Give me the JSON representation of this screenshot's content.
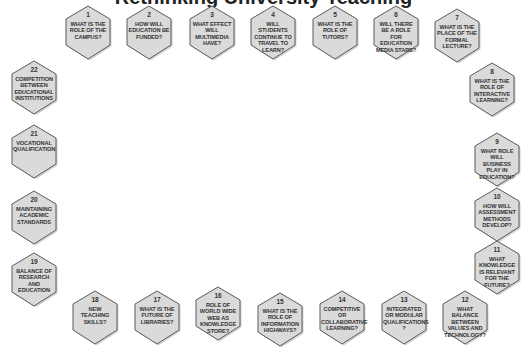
{
  "title": "Rethinking University Teaching",
  "colors": {
    "hex_fill": "#dadada",
    "hex_stroke": "#5a5a5a",
    "text": "#333333",
    "background": "#ffffff"
  },
  "questions": [
    {
      "num": "1",
      "text": "WHAT IS THE ROLE OF THE CAMPUS?",
      "x": 88,
      "y": 33
    },
    {
      "num": "2",
      "text": "HOW WILL EDUCATION BE FUNDED?",
      "x": 149,
      "y": 33
    },
    {
      "num": "3",
      "text": "WHAT EFFECT WILL MULTIMEDIA HAVE?",
      "x": 212,
      "y": 33
    },
    {
      "num": "4",
      "text": "WILL STUDENTS CONTINUE TO TRAVEL TO LEARN?",
      "x": 273,
      "y": 33
    },
    {
      "num": "5",
      "text": "WHAT IS THE ROLE OF TUTORS?",
      "x": 335,
      "y": 33
    },
    {
      "num": "6",
      "text": "WILL THERE BE A ROLE FOR EDUCATION MEDIA STARS?",
      "x": 396,
      "y": 33
    },
    {
      "num": "7",
      "text": "WHAT IS THE PLACE OF THE FORMAL LECTURE?",
      "x": 457,
      "y": 36
    },
    {
      "num": "8",
      "text": "WHAT IS THE ROLE OF INTERACTIVE LEARNING?",
      "x": 492,
      "y": 90
    },
    {
      "num": "9",
      "text": "WHAT ROLE WILL BUSINESS PLAY IN EDUCATION?",
      "x": 497,
      "y": 160
    },
    {
      "num": "10",
      "text": "HOW WILL ASSESSMENT METHODS DEVELOP?",
      "x": 497,
      "y": 215
    },
    {
      "num": "11",
      "text": "WHAT KNOWLEDGE IS RELEVANT FOR THE FUTURE?",
      "x": 497,
      "y": 268
    },
    {
      "num": "12",
      "text": "WHAT BALANCE BETWEEN VALUES AND TECHNOLOGY?",
      "x": 465,
      "y": 318
    },
    {
      "num": "13",
      "text": "INTEGRATED OR MODULAR QUALIFICATIONS ?",
      "x": 404,
      "y": 318
    },
    {
      "num": "14",
      "text": "COMPETITIVE OR COLLABORATIVE LEARNING?",
      "x": 342,
      "y": 318
    },
    {
      "num": "15",
      "text": "WHAT IS THE ROLE OF INFORMATION HIGHWAYS?",
      "x": 280,
      "y": 320
    },
    {
      "num": "16",
      "text": "ROLE OF WORLD WIDE WEB AS KNOWLEDGE STORE?",
      "x": 218,
      "y": 314
    },
    {
      "num": "17",
      "text": "WHAT IS THE FUTURE OF LIBRARIES?",
      "x": 157,
      "y": 318
    },
    {
      "num": "18",
      "text": "NEW TEACHING SKILLS?",
      "x": 95,
      "y": 318
    },
    {
      "num": "19",
      "text": "BALANCE OF RESEARCH AND EDUCATION",
      "x": 34,
      "y": 280
    },
    {
      "num": "20",
      "text": "MAINTAINING ACADEMIC STANDARDS",
      "x": 34,
      "y": 218
    },
    {
      "num": "21",
      "text": "VOCATIONAL QUALIFICATION",
      "x": 34,
      "y": 152
    },
    {
      "num": "22",
      "text": "COMPETITION BETWEEN EDUCATIONAL INSTITUTIONS",
      "x": 34,
      "y": 88
    }
  ]
}
